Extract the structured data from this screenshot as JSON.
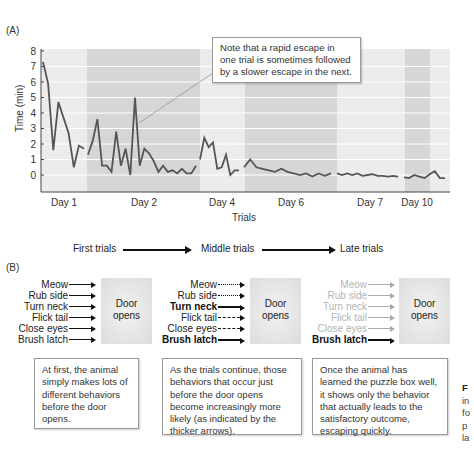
{
  "panel_a": {
    "label": "(A)",
    "callout": {
      "lines": [
        "Note that a rapid escape in",
        "one trial is sometimes followed",
        "by a slower escape in the next."
      ]
    }
  },
  "chart_data": {
    "type": "line",
    "title": "",
    "xlabel": "Trials",
    "ylabel": "Time (min)",
    "ylim": [
      -1,
      8
    ],
    "yticks": [
      0,
      1,
      2,
      3,
      4,
      5,
      6,
      7,
      8
    ],
    "grid": true,
    "legend": null,
    "day_bands": [
      {
        "label": "Day 1",
        "shade": "light"
      },
      {
        "label": "Day 2",
        "shade": "dark"
      },
      {
        "label": "Day 4",
        "shade": "light"
      },
      {
        "label": "Day 6",
        "shade": "dark"
      },
      {
        "label": "Day 7",
        "shade": "light"
      },
      {
        "label": "Day 10",
        "shade": "dark"
      },
      {
        "label": "",
        "shade": "light"
      }
    ],
    "series": [
      {
        "name": "Day 1",
        "values": [
          7.3,
          5.9,
          1.6,
          4.7,
          3.7,
          2.7,
          0.5,
          1.9,
          1.7
        ]
      },
      {
        "name": "Day 2",
        "values": [
          1.3,
          2.2,
          3.6,
          0.6,
          0.6,
          0.2,
          2.8,
          0.6,
          1.7,
          0.0,
          5.0,
          0.6,
          1.7,
          1.4,
          0.9,
          0.2,
          0.6,
          0.2,
          0.3,
          0.1,
          0.4,
          0.1,
          0.1,
          0.6
        ]
      },
      {
        "name": "Day 4",
        "values": [
          1.0,
          2.4,
          1.8,
          2.1,
          0.4,
          0.5,
          1.3,
          0.0,
          0.3,
          0.3
        ]
      },
      {
        "name": "Day 6",
        "values": [
          0.5,
          1.0,
          0.5,
          0.4,
          0.3,
          0.2,
          0.4,
          0.2,
          0.1,
          0.0,
          0.1,
          -0.1,
          0.1,
          -0.05,
          0.1
        ]
      },
      {
        "name": "Day 7",
        "values": [
          0.1,
          0.0,
          0.1,
          0.0,
          0.1,
          -0.05,
          0.0,
          0.05,
          -0.05,
          -0.05,
          -0.1,
          -0.05,
          -0.1
        ]
      },
      {
        "name": "Day 10",
        "values": [
          -0.15,
          -0.2,
          0.0,
          -0.1,
          -0.2,
          0.05,
          0.25,
          -0.2,
          -0.2
        ]
      }
    ],
    "annotation": "Note that a rapid escape in one trial is sometimes followed by a slower escape in the next.",
    "colors": {
      "line": "#555555",
      "band_light": "#ececec",
      "band_dark": "#d6d6d6",
      "grid": "#ffffff"
    }
  },
  "progression": {
    "first": "First trials",
    "middle": "Middle trials",
    "late": "Late trials"
  },
  "panel_b": {
    "label": "(B)",
    "door_label": [
      "Door",
      "opens"
    ],
    "stages": [
      {
        "behaviors": [
          {
            "label": "Meow",
            "style": "solid",
            "emphasis": "normal"
          },
          {
            "label": "Rub side",
            "style": "solid",
            "emphasis": "normal"
          },
          {
            "label": "Turn neck",
            "style": "solid",
            "emphasis": "normal"
          },
          {
            "label": "Flick tail",
            "style": "solid",
            "emphasis": "normal"
          },
          {
            "label": "Close eyes",
            "style": "solid",
            "emphasis": "normal"
          },
          {
            "label": "Brush latch",
            "style": "solid",
            "emphasis": "normal"
          }
        ],
        "description": [
          "At first, the animal",
          "simply makes lots of",
          "different behaviors",
          "before the door",
          "opens."
        ]
      },
      {
        "behaviors": [
          {
            "label": "Meow",
            "style": "dotted",
            "emphasis": "normal"
          },
          {
            "label": "Rub side",
            "style": "dotted",
            "emphasis": "normal"
          },
          {
            "label": "Turn neck",
            "style": "thick",
            "emphasis": "bold"
          },
          {
            "label": "Flick tail",
            "style": "dashed",
            "emphasis": "normal"
          },
          {
            "label": "Close eyes",
            "style": "dashed",
            "emphasis": "normal"
          },
          {
            "label": "Brush latch",
            "style": "thick",
            "emphasis": "bold"
          }
        ],
        "description": [
          "As the trials continue, those",
          "behaviors that occur just",
          "before the door opens",
          "become increasingly more",
          "likely (as indicated by the",
          "thicker arrows)."
        ]
      },
      {
        "behaviors": [
          {
            "label": "Meow",
            "style": "faded",
            "emphasis": "faded"
          },
          {
            "label": "Rub side",
            "style": "faded",
            "emphasis": "faded"
          },
          {
            "label": "Turn neck",
            "style": "faded",
            "emphasis": "faded"
          },
          {
            "label": "Flick tail",
            "style": "faded",
            "emphasis": "faded"
          },
          {
            "label": "Close eyes",
            "style": "faded",
            "emphasis": "faded"
          },
          {
            "label": "Brush latch",
            "style": "thick",
            "emphasis": "bold"
          }
        ],
        "description": [
          "Once the animal has",
          "learned the puzzle box well,",
          "it shows only the behavior",
          "that actually leads to the",
          "satisfactory outcome,",
          "escaping quickly."
        ]
      }
    ]
  },
  "figure_caption_fragment": {
    "lines": [
      "F",
      "in",
      "fo",
      "p",
      "la"
    ]
  }
}
